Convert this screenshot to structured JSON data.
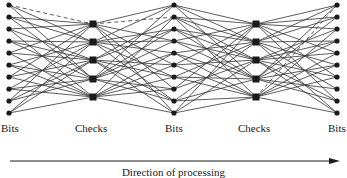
{
  "figure": {
    "column_labels": [
      {
        "text": "Bits",
        "x": 1,
        "y": 122
      },
      {
        "text": "Checks",
        "x": 75,
        "y": 122
      },
      {
        "text": "Bits",
        "x": 165,
        "y": 122
      },
      {
        "text": "Checks",
        "x": 238,
        "y": 122
      },
      {
        "text": "Bits",
        "x": 328,
        "y": 122
      }
    ],
    "caption": "Direction of processing",
    "colors": {
      "ink": "#1a1a1a",
      "edge": "#333333"
    },
    "columns": [
      {
        "type": "bits",
        "x": 9,
        "ys": [
          5,
          17,
          29,
          41,
          53,
          65,
          77,
          89,
          101,
          113
        ]
      },
      {
        "type": "checks",
        "x": 93,
        "ys": [
          24,
          42,
          60,
          79,
          97
        ]
      },
      {
        "type": "bits",
        "x": 174,
        "ys": [
          5,
          17,
          29,
          41,
          53,
          65,
          77,
          89,
          101,
          113
        ]
      },
      {
        "type": "checks",
        "x": 256,
        "ys": [
          24,
          42,
          60,
          79,
          97
        ]
      },
      {
        "type": "bits",
        "x": 337,
        "ys": [
          5,
          17,
          29,
          41,
          53,
          65,
          77,
          89,
          101,
          113
        ]
      }
    ],
    "edges_left_bits_to_checks1": [
      [
        0,
        0,
        "dashed"
      ],
      [
        1,
        0
      ],
      [
        2,
        0
      ],
      [
        4,
        0
      ],
      [
        6,
        0
      ],
      [
        8,
        0
      ],
      [
        1,
        1
      ],
      [
        3,
        1
      ],
      [
        5,
        1
      ],
      [
        7,
        1
      ],
      [
        9,
        1
      ],
      [
        0,
        1
      ],
      [
        2,
        2
      ],
      [
        3,
        2
      ],
      [
        4,
        2
      ],
      [
        6,
        2
      ],
      [
        8,
        2
      ],
      [
        9,
        2
      ],
      [
        0,
        3
      ],
      [
        1,
        3
      ],
      [
        5,
        3
      ],
      [
        7,
        3
      ],
      [
        8,
        3
      ],
      [
        3,
        3
      ],
      [
        2,
        4
      ],
      [
        4,
        4
      ],
      [
        5,
        4
      ],
      [
        6,
        4
      ],
      [
        7,
        4
      ],
      [
        9,
        4
      ]
    ],
    "edges_checks1_to_mid_bits": [
      [
        0,
        1,
        "dashed"
      ],
      [
        0,
        0
      ],
      [
        0,
        3
      ],
      [
        0,
        5
      ],
      [
        0,
        7
      ],
      [
        0,
        9
      ],
      [
        1,
        0
      ],
      [
        1,
        2
      ],
      [
        1,
        4
      ],
      [
        1,
        6
      ],
      [
        1,
        8
      ],
      [
        1,
        3
      ],
      [
        2,
        1
      ],
      [
        2,
        2
      ],
      [
        2,
        5
      ],
      [
        2,
        6
      ],
      [
        2,
        9
      ],
      [
        2,
        8
      ],
      [
        3,
        0
      ],
      [
        3,
        3
      ],
      [
        3,
        4
      ],
      [
        3,
        7
      ],
      [
        3,
        8
      ],
      [
        3,
        2
      ],
      [
        4,
        1
      ],
      [
        4,
        4
      ],
      [
        4,
        5
      ],
      [
        4,
        6
      ],
      [
        4,
        7
      ],
      [
        4,
        9
      ]
    ],
    "edges_mid_bits_to_checks2": [
      [
        0,
        0
      ],
      [
        1,
        0
      ],
      [
        3,
        0
      ],
      [
        5,
        0
      ],
      [
        7,
        0
      ],
      [
        9,
        0
      ],
      [
        0,
        1
      ],
      [
        2,
        1
      ],
      [
        4,
        1
      ],
      [
        6,
        1
      ],
      [
        8,
        1
      ],
      [
        1,
        1
      ],
      [
        1,
        2
      ],
      [
        2,
        2
      ],
      [
        3,
        2
      ],
      [
        5,
        2
      ],
      [
        7,
        2
      ],
      [
        9,
        2
      ],
      [
        0,
        3
      ],
      [
        2,
        3
      ],
      [
        4,
        3
      ],
      [
        6,
        3
      ],
      [
        8,
        3
      ],
      [
        3,
        3
      ],
      [
        1,
        4
      ],
      [
        4,
        4
      ],
      [
        5,
        4
      ],
      [
        6,
        4
      ],
      [
        8,
        4
      ],
      [
        9,
        4
      ]
    ],
    "edges_checks2_to_right_bits": [
      [
        0,
        0
      ],
      [
        0,
        1
      ],
      [
        0,
        2
      ],
      [
        0,
        4
      ],
      [
        0,
        6
      ],
      [
        0,
        8
      ],
      [
        1,
        1
      ],
      [
        1,
        3
      ],
      [
        1,
        5
      ],
      [
        1,
        7
      ],
      [
        1,
        9
      ],
      [
        1,
        0
      ],
      [
        2,
        2
      ],
      [
        2,
        3
      ],
      [
        2,
        4
      ],
      [
        2,
        6
      ],
      [
        2,
        8
      ],
      [
        2,
        9
      ],
      [
        3,
        0
      ],
      [
        3,
        1
      ],
      [
        3,
        5
      ],
      [
        3,
        7
      ],
      [
        3,
        8
      ],
      [
        3,
        3
      ],
      [
        4,
        0,
        "dashed"
      ],
      [
        4,
        2
      ],
      [
        4,
        4
      ],
      [
        4,
        5
      ],
      [
        4,
        6
      ],
      [
        4,
        9
      ]
    ],
    "arrow": {
      "x1": 10,
      "y1": 161,
      "x2": 340,
      "y2": 161
    }
  }
}
